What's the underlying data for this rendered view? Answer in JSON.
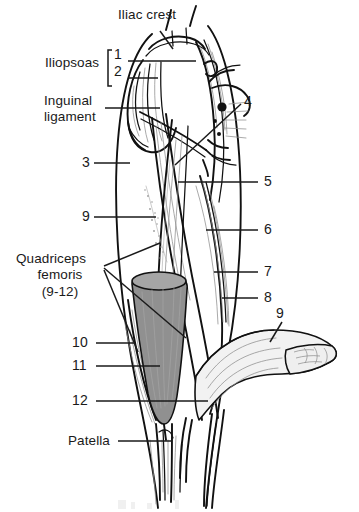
{
  "figure": {
    "background_color": "#ffffff",
    "ink_color": "#1a1a1a",
    "muscle_shading_color": "#909090",
    "width": 359,
    "height": 512
  },
  "labels": {
    "iliac_crest": "Iliac crest",
    "iliopsoas": "Iliopsoas",
    "iliopsoas_item_1": "1",
    "iliopsoas_item_2": "2",
    "inguinal_ligament_line1": "Inguinal",
    "inguinal_ligament_line2": "ligament",
    "num_3": "3",
    "num_4": "4",
    "num_5": "5",
    "num_6": "6",
    "num_7": "7",
    "num_8": "8",
    "num_9_left": "9",
    "num_9_right": "9",
    "quadriceps_line1": "Quadriceps",
    "quadriceps_line2": "femoris",
    "quadriceps_line3": "(9-12)",
    "num_10": "10",
    "num_11": "11",
    "num_12": "12",
    "patella": "Patella"
  },
  "callouts": [
    {
      "id": "iliac-crest",
      "text": "Iliac crest",
      "x": 118,
      "y": 14
    },
    {
      "id": "iliopsoas",
      "text": "Iliopsoas",
      "x": 45,
      "y": 62
    },
    {
      "id": "iliopsoas-1",
      "text": "1",
      "x": 113,
      "y": 55
    },
    {
      "id": "iliopsoas-2",
      "text": "2",
      "x": 113,
      "y": 72
    },
    {
      "id": "inguinal-ligament",
      "text": "Inguinal ligament",
      "x": 44,
      "y": 100
    },
    {
      "id": "number-3",
      "text": "3",
      "x": 82,
      "y": 158
    },
    {
      "id": "number-4",
      "text": "4",
      "x": 245,
      "y": 99
    },
    {
      "id": "number-5",
      "text": "5",
      "x": 264,
      "y": 176
    },
    {
      "id": "number-6",
      "text": "6",
      "x": 264,
      "y": 224
    },
    {
      "id": "number-7",
      "text": "7",
      "x": 264,
      "y": 266
    },
    {
      "id": "number-8",
      "text": "8",
      "x": 264,
      "y": 292
    },
    {
      "id": "number-9-left",
      "text": "9",
      "x": 82,
      "y": 212
    },
    {
      "id": "number-9-right",
      "text": "9",
      "x": 277,
      "y": 314
    },
    {
      "id": "quadriceps-femoris",
      "text": "Quadriceps femoris (9-12)",
      "x": 18,
      "y": 258
    },
    {
      "id": "number-10",
      "text": "10",
      "x": 78,
      "y": 338
    },
    {
      "id": "number-11",
      "text": "11",
      "x": 78,
      "y": 361
    },
    {
      "id": "number-12",
      "text": "12",
      "x": 78,
      "y": 396
    },
    {
      "id": "patella",
      "text": "Patella",
      "x": 68,
      "y": 436
    }
  ]
}
